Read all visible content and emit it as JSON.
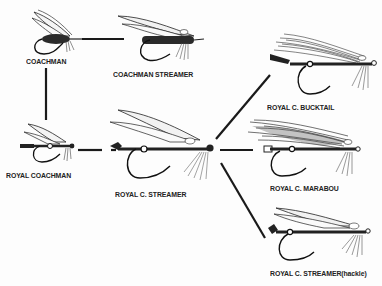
{
  "diagram": {
    "nodes": [
      {
        "id": "coachman",
        "label": "COACHMAN"
      },
      {
        "id": "coachman_streamer",
        "label": "COACHMAN STREAMER"
      },
      {
        "id": "royal_coachman",
        "label": "ROYAL COACHMAN"
      },
      {
        "id": "royal_c_streamer",
        "label": "ROYAL C. STREAMER"
      },
      {
        "id": "royal_c_bucktail",
        "label": "ROYAL C. BUCKTAIL"
      },
      {
        "id": "royal_c_marabou",
        "label": "ROYAL C. MARABOU"
      },
      {
        "id": "royal_c_streamer_hackle",
        "label": "ROYAL C. STREAMER(hackle)"
      }
    ],
    "edges": [
      {
        "from": "coachman",
        "to": "coachman_streamer"
      },
      {
        "from": "coachman",
        "to": "royal_coachman"
      },
      {
        "from": "royal_coachman",
        "to": "royal_c_streamer"
      },
      {
        "from": "royal_c_streamer",
        "to": "royal_c_bucktail"
      },
      {
        "from": "royal_c_streamer",
        "to": "royal_c_marabou"
      },
      {
        "from": "royal_c_streamer",
        "to": "royal_c_streamer_hackle"
      }
    ],
    "colors": {
      "ink": "#1a1a1a",
      "background": "#fdfdfd"
    }
  }
}
